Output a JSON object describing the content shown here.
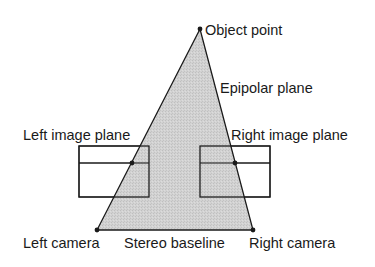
{
  "diagram": {
    "type": "stereo-epipolar-geometry",
    "colors": {
      "background": "#ffffff",
      "stroke": "#1a1a1a",
      "plane_fill": "#c9c9c9",
      "box_fill": "#ffffff"
    },
    "labels": {
      "object_point": "Object point",
      "epipolar_plane": "Epipolar plane",
      "left_image_plane": "Left image plane",
      "right_image_plane": "Right image plane",
      "left_camera": "Left camera",
      "stereo_baseline": "Stereo baseline",
      "right_camera": "Right camera"
    },
    "points": {
      "object_point": [
        200,
        29
      ],
      "left_camera": [
        97,
        230
      ],
      "right_camera": [
        253,
        230
      ],
      "left_projection": [
        132,
        163
      ],
      "right_projection": [
        235,
        163
      ]
    },
    "image_planes": {
      "left": {
        "x": 79,
        "y": 146,
        "w": 70,
        "h": 51,
        "epipolar_line_y": 163
      },
      "right": {
        "x": 200,
        "y": 146,
        "w": 70,
        "h": 51,
        "epipolar_line_y": 163
      }
    }
  }
}
